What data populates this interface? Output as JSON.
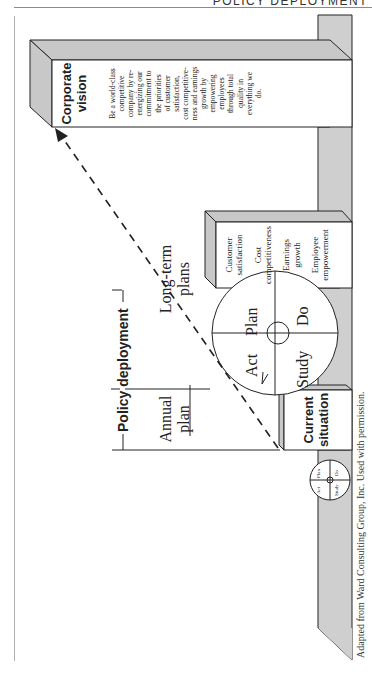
{
  "page_header": "POLICY DEPLOYMENT",
  "diagram": {
    "title_bracket": "Policy deployment",
    "annual_plan": [
      "Annual",
      "plan"
    ],
    "long_term_plans": [
      "Long-term",
      "plans"
    ],
    "pdca_large": {
      "plan": "Plan",
      "do": "Do",
      "study": "Study",
      "act": "Act"
    },
    "pdca_small": {
      "plan": "Plan",
      "do": "Do",
      "study": "Study",
      "act": "Act"
    },
    "current_situation": {
      "title": [
        "Current",
        "situation"
      ]
    },
    "middle_box": {
      "items": [
        [
          "Customer",
          "satisfaction"
        ],
        [
          "Cost",
          "competitiveness"
        ],
        [
          "Earnings",
          "growth"
        ],
        [
          "Employee",
          "empowerment"
        ]
      ]
    },
    "corporate_vision": {
      "title": [
        "Corporate",
        "vision"
      ],
      "lines": [
        "Be a world-class",
        "competitive",
        "company by re-",
        "energizing our",
        "commitment to",
        "the priorities",
        "of customer",
        "satisfaction,",
        "cost competitive-",
        "ness and earnings",
        "growth by",
        "empowering",
        "employees",
        "through total",
        "quality in",
        "everything we",
        "do."
      ]
    },
    "caption": "Adapted from Ward Consulting Group, Inc. Used with permission.",
    "colors": {
      "ground": "#cfcfcf",
      "box_side": "#c8c8c8",
      "line": "#222222"
    }
  }
}
